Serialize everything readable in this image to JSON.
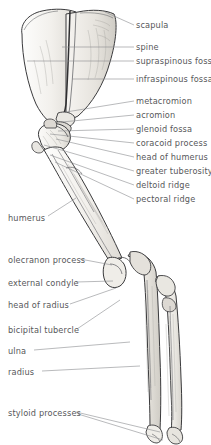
{
  "figure": {
    "background_color": "#ffffff",
    "text_color": "#57585a",
    "leader_color": "#8a8c8e",
    "bone_outline_color": "#3a3a3c",
    "bone_fill_color": "#f7f6f4",
    "bone_shade_color": "#dddbd6",
    "width": 211,
    "height": 445
  },
  "labels_right": [
    {
      "id": "scapula",
      "text": "scapula",
      "x": 136,
      "y": 27,
      "leader": {
        "x1": 134,
        "y1": 25,
        "x2": 105,
        "y2": 12
      }
    },
    {
      "id": "spine",
      "text": "spine",
      "x": 136,
      "y": 49,
      "leader": {
        "x1": 134,
        "y1": 47,
        "x2": 62,
        "y2": 47
      }
    },
    {
      "id": "supraspinous-fossa",
      "text": "supraspinous fossa",
      "x": 136,
      "y": 63,
      "leader": {
        "x1": 134,
        "y1": 61,
        "x2": 27,
        "y2": 61
      }
    },
    {
      "id": "infraspinous-fossa",
      "text": "infraspinous fossa",
      "x": 136,
      "y": 81,
      "leader": {
        "x1": 134,
        "y1": 79,
        "x2": 72,
        "y2": 79
      }
    },
    {
      "id": "metacromion",
      "text": "metacromion",
      "x": 136,
      "y": 103,
      "leader": {
        "x1": 134,
        "y1": 101,
        "x2": 66,
        "y2": 112
      }
    },
    {
      "id": "acromion",
      "text": "acromion",
      "x": 136,
      "y": 117,
      "leader": {
        "x1": 134,
        "y1": 115,
        "x2": 62,
        "y2": 122
      }
    },
    {
      "id": "glenoid-fossa",
      "text": "glenoid fossa",
      "x": 136,
      "y": 131,
      "leader": {
        "x1": 134,
        "y1": 129,
        "x2": 58,
        "y2": 131
      }
    },
    {
      "id": "coracoid-process",
      "text": "coracoid process",
      "x": 136,
      "y": 145,
      "leader": {
        "x1": 134,
        "y1": 143,
        "x2": 50,
        "y2": 134
      }
    },
    {
      "id": "head-of-humerus",
      "text": "head of humerus",
      "x": 136,
      "y": 159,
      "leader": {
        "x1": 134,
        "y1": 157,
        "x2": 56,
        "y2": 139
      }
    },
    {
      "id": "greater-tuberosity",
      "text": "greater tuberosity",
      "x": 136,
      "y": 173,
      "leader": {
        "x1": 134,
        "y1": 171,
        "x2": 44,
        "y2": 145
      }
    },
    {
      "id": "deltoid-ridge",
      "text": "deltoid ridge",
      "x": 136,
      "y": 187,
      "leader": {
        "x1": 134,
        "y1": 185,
        "x2": 50,
        "y2": 155
      }
    },
    {
      "id": "pectoral-ridge",
      "text": "pectoral ridge",
      "x": 136,
      "y": 201,
      "leader": {
        "x1": 134,
        "y1": 199,
        "x2": 55,
        "y2": 162
      }
    }
  ],
  "labels_left": [
    {
      "id": "humerus",
      "text": "humerus",
      "x": 8,
      "y": 220,
      "leader": {
        "x1": 48,
        "y1": 216,
        "x2": 76,
        "y2": 198
      }
    },
    {
      "id": "olecranon-process",
      "text": "olecranon process",
      "x": 8,
      "y": 262,
      "leader": {
        "x1": 80,
        "y1": 259,
        "x2": 112,
        "y2": 265
      }
    },
    {
      "id": "external-condyle",
      "text": "external condyle",
      "x": 8,
      "y": 285,
      "leader": {
        "x1": 76,
        "y1": 282,
        "x2": 113,
        "y2": 281
      }
    },
    {
      "id": "head-of-radius",
      "text": "head of radius",
      "x": 8,
      "y": 307,
      "leader": {
        "x1": 70,
        "y1": 304,
        "x2": 116,
        "y2": 288
      }
    },
    {
      "id": "bicipital-tubercle",
      "text": "bicipital tubercle",
      "x": 8,
      "y": 332,
      "leader": {
        "x1": 77,
        "y1": 329,
        "x2": 120,
        "y2": 300
      }
    },
    {
      "id": "ulna",
      "text": "ulna",
      "x": 8,
      "y": 353,
      "leader": {
        "x1": 34,
        "y1": 350,
        "x2": 130,
        "y2": 342
      }
    },
    {
      "id": "radius",
      "text": "radius",
      "x": 8,
      "y": 374,
      "leader": {
        "x1": 42,
        "y1": 371,
        "x2": 140,
        "y2": 366
      }
    },
    {
      "id": "styloid-processes",
      "text": "styloid processes",
      "x": 8,
      "y": 415,
      "leader": {
        "x1": 76,
        "y1": 412,
        "x2": 160,
        "y2": 432
      }
    },
    {
      "id": "styloid-processes-second-leader",
      "text": "",
      "x": 0,
      "y": 0,
      "leader": {
        "x1": 78,
        "y1": 414,
        "x2": 163,
        "y2": 440
      }
    }
  ]
}
